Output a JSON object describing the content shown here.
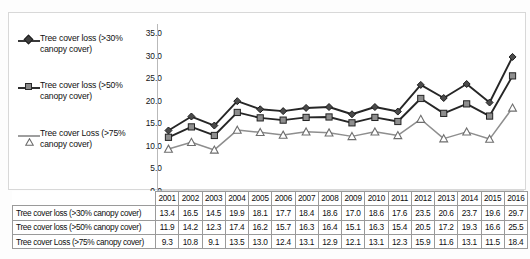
{
  "legend": {
    "items": [
      {
        "label": "Tree cover loss (>30% canopy cover)",
        "marker": "diamond-marker",
        "color": "#3a3a3a"
      },
      {
        "label": "Tree cover loss (>50% canopy cover)",
        "marker": "square-marker",
        "color": "#8a8a8a"
      },
      {
        "label": "Tree cover Loss (>75% canopy cover)",
        "marker": "triangle-marker",
        "color": "#9e9e9e"
      }
    ]
  },
  "axis": {
    "y_ticks": [
      "35.0",
      "30.0",
      "25.0",
      "20.0",
      "15.0",
      "10.0",
      "5.0",
      "0.0"
    ]
  },
  "table": {
    "corner": "",
    "years": [
      "2001",
      "2002",
      "2003",
      "2004",
      "2005",
      "2006",
      "2007",
      "2008",
      "2009",
      "2010",
      "2011",
      "2012",
      "2013",
      "2014",
      "2015",
      "2016"
    ],
    "rows": [
      {
        "label": "Tree cover loss (>30% canopy cover)",
        "values": [
          "13.4",
          "16.5",
          "14.5",
          "19.9",
          "18.1",
          "17.7",
          "18.4",
          "18.6",
          "17.0",
          "18.6",
          "17.6",
          "23.5",
          "20.6",
          "23.7",
          "19.6",
          "29.7"
        ]
      },
      {
        "label": "Tree cover loss (>50% canopy cover)",
        "values": [
          "11.9",
          "14.2",
          "12.3",
          "17.4",
          "16.2",
          "15.7",
          "16.3",
          "16.4",
          "15.1",
          "16.3",
          "15.4",
          "20.5",
          "17.2",
          "19.3",
          "16.6",
          "25.5"
        ]
      },
      {
        "label": "Tree cover Loss (>75% canopy cover)",
        "values": [
          "9.3",
          "10.8",
          "9.1",
          "13.5",
          "13.0",
          "12.4",
          "13.1",
          "12.9",
          "12.1",
          "13.1",
          "12.3",
          "15.9",
          "11.6",
          "13.1",
          "11.5",
          "18.4"
        ]
      }
    ]
  },
  "chart_data": {
    "type": "line",
    "title": "",
    "xlabel": "",
    "ylabel": "",
    "ylim": [
      0,
      35
    ],
    "ytick_step": 5,
    "grid": false,
    "legend_position": "left",
    "categories": [
      "2001",
      "2002",
      "2003",
      "2004",
      "2005",
      "2006",
      "2007",
      "2008",
      "2009",
      "2010",
      "2011",
      "2012",
      "2013",
      "2014",
      "2015",
      "2016"
    ],
    "series": [
      {
        "name": "Tree cover loss (>30% canopy cover)",
        "marker": "diamond",
        "color": "#3a3a3a",
        "values": [
          13.4,
          16.5,
          14.5,
          19.9,
          18.1,
          17.7,
          18.4,
          18.6,
          17.0,
          18.6,
          17.6,
          23.5,
          20.6,
          23.7,
          19.6,
          29.7
        ]
      },
      {
        "name": "Tree cover loss (>50% canopy cover)",
        "marker": "square",
        "color": "#8a8a8a",
        "values": [
          11.9,
          14.2,
          12.3,
          17.4,
          16.2,
          15.7,
          16.3,
          16.4,
          15.1,
          16.3,
          15.4,
          20.5,
          17.2,
          19.3,
          16.6,
          25.5
        ]
      },
      {
        "name": "Tree cover Loss (>75% canopy cover)",
        "marker": "triangle",
        "color": "#9e9e9e",
        "values": [
          9.3,
          10.8,
          9.1,
          13.5,
          13.0,
          12.4,
          13.1,
          12.9,
          12.1,
          13.1,
          12.3,
          15.9,
          11.6,
          13.1,
          11.5,
          18.4
        ]
      }
    ]
  }
}
